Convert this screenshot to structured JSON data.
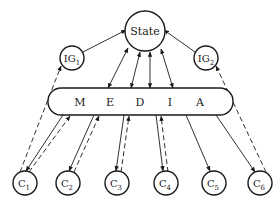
{
  "diagram": {
    "state": {
      "label": "State"
    },
    "info_generators": [
      {
        "base": "IG",
        "sub": "1"
      },
      {
        "base": "IG",
        "sub": "2"
      }
    ],
    "media": {
      "letters": [
        "M",
        "E",
        "D",
        "I",
        "A"
      ]
    },
    "clients": [
      {
        "base": "C",
        "sub": "1"
      },
      {
        "base": "C",
        "sub": "2"
      },
      {
        "base": "C",
        "sub": "3"
      },
      {
        "base": "C",
        "sub": "4"
      },
      {
        "base": "C",
        "sub": "5"
      },
      {
        "base": "C",
        "sub": "6"
      }
    ],
    "colors": {
      "stroke": "#1a1a1a",
      "background": "#ffffff"
    }
  }
}
